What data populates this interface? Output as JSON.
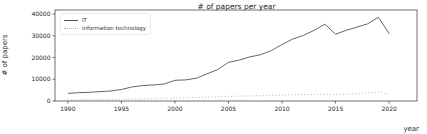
{
  "chart_data": {
    "type": "line",
    "title": "# of papers per year",
    "xlabel": "year",
    "ylabel": "# of papers",
    "x": [
      1990,
      1991,
      1992,
      1993,
      1994,
      1995,
      1996,
      1997,
      1998,
      1999,
      2000,
      2001,
      2002,
      2003,
      2004,
      2005,
      2006,
      2007,
      2008,
      2009,
      2010,
      2011,
      2012,
      2013,
      2014,
      2015,
      2016,
      2017,
      2018,
      2019,
      2020
    ],
    "series": [
      {
        "name": "IT",
        "style": "solid",
        "color": "#555555",
        "values": [
          3500,
          3800,
          4000,
          4300,
          4600,
          5300,
          6500,
          7100,
          7400,
          7800,
          9500,
          9700,
          10500,
          12500,
          14500,
          17800,
          18800,
          20300,
          21300,
          23200,
          26000,
          28500,
          30200,
          32500,
          35300,
          30700,
          32500,
          34000,
          35500,
          38500,
          31000
        ]
      },
      {
        "name": "information technology",
        "style": "dotted",
        "color": "#ababab",
        "values": [
          500,
          550,
          600,
          650,
          700,
          800,
          950,
          1050,
          1150,
          1250,
          1400,
          1500,
          1650,
          1800,
          1950,
          2100,
          2250,
          2350,
          2450,
          2550,
          2700,
          2850,
          2950,
          3050,
          3100,
          3000,
          3100,
          3300,
          3700,
          4200,
          3000
        ]
      }
    ],
    "xticks": [
      1990,
      1995,
      2000,
      2005,
      2010,
      2015,
      2020
    ],
    "yticks": [
      0,
      10000,
      20000,
      30000,
      40000
    ],
    "xlim": [
      1988.8,
      2022.6
    ],
    "ylim": [
      0,
      41850
    ],
    "legend_position": "upper left",
    "grid": false,
    "axis_color": "#333333",
    "tick_label_color": "#262626"
  }
}
